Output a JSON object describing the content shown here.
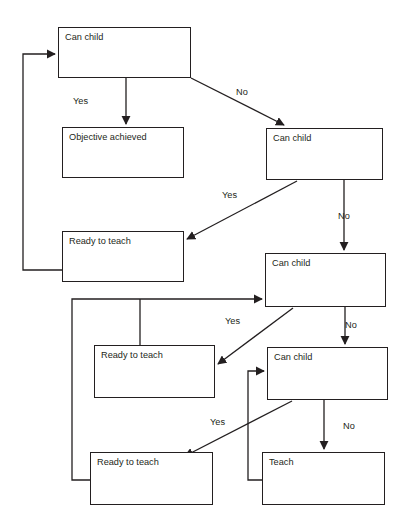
{
  "diagram": {
    "background_color": "#ffffff",
    "line_color": "#231f20",
    "nodes": [
      {
        "id": "can-child-1",
        "label": "Can child",
        "x": 58,
        "y": 27,
        "w": 133,
        "h": 51
      },
      {
        "id": "objective-achieved",
        "label": "Objective achieved",
        "x": 62,
        "y": 127,
        "w": 122,
        "h": 51
      },
      {
        "id": "can-child-2",
        "label": "Can child",
        "x": 266,
        "y": 128,
        "w": 117,
        "h": 52
      },
      {
        "id": "ready-to-teach-1",
        "label": "Ready to teach",
        "x": 62,
        "y": 231,
        "w": 122,
        "h": 51
      },
      {
        "id": "can-child-3",
        "label": "Can child",
        "x": 265,
        "y": 253,
        "w": 121,
        "h": 54
      },
      {
        "id": "ready-to-teach-2",
        "label": "Ready to teach",
        "x": 94,
        "y": 345,
        "w": 121,
        "h": 53
      },
      {
        "id": "can-child-4",
        "label": "Can child",
        "x": 267,
        "y": 347,
        "w": 121,
        "h": 53
      },
      {
        "id": "ready-to-teach-3",
        "label": "Ready to teach",
        "x": 90,
        "y": 452,
        "w": 123,
        "h": 53
      },
      {
        "id": "teach",
        "label": "Teach",
        "x": 262,
        "y": 452,
        "w": 123,
        "h": 53
      }
    ],
    "edge_labels": [
      {
        "id": "yes-1",
        "text": "Yes",
        "x": 73,
        "y": 96
      },
      {
        "id": "no-1",
        "text": "No",
        "x": 236,
        "y": 87
      },
      {
        "id": "yes-2",
        "text": "Yes",
        "x": 222,
        "y": 190
      },
      {
        "id": "no-2",
        "text": "No",
        "x": 338,
        "y": 211
      },
      {
        "id": "yes-3",
        "text": "Yes",
        "x": 225,
        "y": 316
      },
      {
        "id": "no-3",
        "text": "No",
        "x": 345,
        "y": 320
      },
      {
        "id": "yes-4",
        "text": "Yes",
        "x": 210,
        "y": 417
      },
      {
        "id": "no-4",
        "text": "No",
        "x": 343,
        "y": 421
      }
    ]
  }
}
